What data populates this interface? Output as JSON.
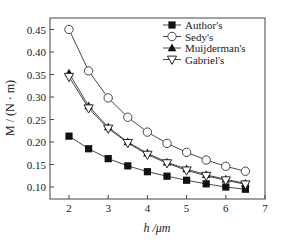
{
  "chart_data": {
    "type": "line",
    "title": "",
    "xlabel": "h /μm",
    "ylabel": "M / (N · m)",
    "xlim": [
      1.5,
      7
    ],
    "ylim": [
      0.075,
      0.475
    ],
    "xticks": [
      2,
      3,
      4,
      5,
      6,
      7
    ],
    "yticks": [
      0.1,
      0.15,
      0.2,
      0.25,
      0.3,
      0.35,
      0.4,
      0.45
    ],
    "ytick_labels": [
      "0.10",
      "0.15",
      "0.20",
      "0.25",
      "0.30",
      "0.35",
      "0.40",
      "0.45"
    ],
    "grid": false,
    "legend_position": "upper right",
    "x": [
      2,
      2.5,
      3,
      3.5,
      4,
      4.5,
      5,
      5.5,
      6,
      6.5
    ],
    "series": [
      {
        "name": "Author's",
        "marker": "filled-square",
        "values": [
          0.213,
          0.185,
          0.163,
          0.147,
          0.134,
          0.124,
          0.115,
          0.107,
          0.1,
          0.095
        ]
      },
      {
        "name": "Sedy's",
        "marker": "open-circle",
        "values": [
          0.45,
          0.358,
          0.298,
          0.255,
          0.222,
          0.197,
          0.177,
          0.16,
          0.146,
          0.135
        ]
      },
      {
        "name": "Muijderman's",
        "marker": "filled-triangle-up",
        "values": [
          0.353,
          0.28,
          0.233,
          0.2,
          0.175,
          0.155,
          0.14,
          0.127,
          0.117,
          0.108
        ]
      },
      {
        "name": "Gabriel's",
        "marker": "open-triangle-down",
        "values": [
          0.345,
          0.275,
          0.23,
          0.198,
          0.172,
          0.153,
          0.137,
          0.125,
          0.115,
          0.106
        ]
      }
    ]
  }
}
